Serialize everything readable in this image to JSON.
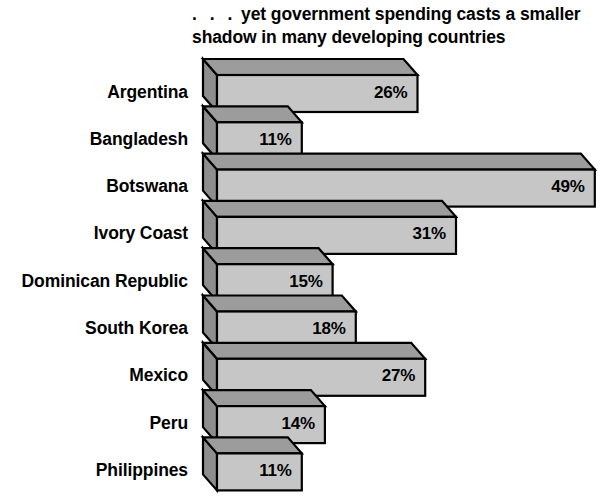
{
  "title": {
    "dots": ". . .",
    "line1": "yet government spending casts a smaller",
    "line2": "shadow in many developing countries",
    "full": ". . . yet government spending casts a smaller shadow in many developing countries"
  },
  "colors": {
    "background": "#ffffff",
    "bar_front": "#c6c6c6",
    "bar_top": "#9c9c9c",
    "bar_side": "#8e8e8e",
    "outline": "#000000",
    "text": "#000000"
  },
  "chart_data": {
    "type": "bar",
    "orientation": "horizontal",
    "style": "3d-isometric",
    "title": ". . . yet government spending casts a smaller shadow in many developing countries",
    "xlabel": "",
    "ylabel": "",
    "xlim": [
      0,
      52
    ],
    "grid": false,
    "legend": null,
    "value_suffix": "%",
    "categories": [
      "Argentina",
      "Bangladesh",
      "Botswana",
      "Ivory Coast",
      "Dominican Republic",
      "South Korea",
      "Mexico",
      "Peru",
      "Philippines"
    ],
    "values": [
      26,
      11,
      49,
      31,
      15,
      18,
      27,
      14,
      11
    ],
    "value_labels": [
      "26%",
      "11%",
      "49%",
      "31%",
      "15%",
      "18%",
      "27%",
      "14%",
      "11%"
    ],
    "bars": [
      {
        "category": "Argentina",
        "value": 26,
        "label": "26%"
      },
      {
        "category": "Bangladesh",
        "value": 11,
        "label": "11%"
      },
      {
        "category": "Botswana",
        "value": 49,
        "label": "49%"
      },
      {
        "category": "Ivory Coast",
        "value": 31,
        "label": "31%"
      },
      {
        "category": "Dominican Republic",
        "value": 15,
        "label": "15%"
      },
      {
        "category": "South Korea",
        "value": 18,
        "label": "18%"
      },
      {
        "category": "Mexico",
        "value": 27,
        "label": "27%"
      },
      {
        "category": "Peru",
        "value": 14,
        "label": "14%"
      },
      {
        "category": "Philippines",
        "value": 11,
        "label": "11%"
      }
    ]
  }
}
